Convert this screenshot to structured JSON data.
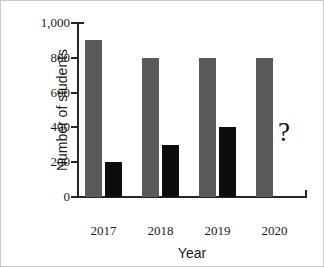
{
  "chart_data": {
    "type": "bar",
    "title": "",
    "xlabel": "Year",
    "ylabel": "Number of students",
    "categories": [
      "2017",
      "2018",
      "2019",
      "2020"
    ],
    "series": [
      {
        "name": "gray-series",
        "color": "#5a5a5a",
        "values": [
          900,
          800,
          800,
          800
        ]
      },
      {
        "name": "black-series",
        "color": "#0d0d0d",
        "values": [
          200,
          300,
          400,
          null
        ]
      }
    ],
    "ylim": [
      0,
      1000
    ],
    "yticks": [
      0,
      200,
      400,
      600,
      800,
      1000
    ],
    "ytick_labels": [
      "0",
      "200",
      "400",
      "600",
      "800",
      "1,000"
    ],
    "grid": false,
    "legend": "none",
    "annotations": [
      {
        "name": "missing-value-marker",
        "text": "?",
        "category": "2020",
        "series": "black-series"
      }
    ]
  },
  "figure": {
    "frame_color": "#c9c9c9",
    "background": "#ffffff",
    "axis_color": "#262626"
  }
}
